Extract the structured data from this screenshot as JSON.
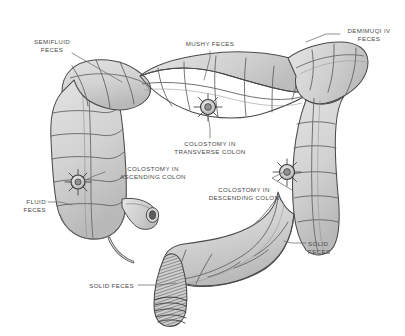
{
  "figure": {
    "background_color": "#ffffff",
    "colon_fill_color": "#d4d4d4",
    "colon_outline_color": "#4a4a4a",
    "label_color": "#4a4a4a",
    "leader_color": "#6b6b6b",
    "rectum_hatch_color": "#5a5a5a"
  },
  "labels": [
    {
      "id": "semifluid-feces",
      "line1": "SEMIFLUID",
      "line2": "FECES",
      "align": "center",
      "x": 24,
      "y": 38,
      "w": 56,
      "leader": [
        [
          72,
          53
        ],
        [
          84,
          60
        ],
        [
          122,
          82
        ]
      ]
    },
    {
      "id": "mushy-feces",
      "line1": "MUSHY FECES",
      "line2": "",
      "align": "center",
      "x": 178,
      "y": 40,
      "w": 64,
      "leader": [
        [
          210,
          51
        ],
        [
          210,
          58
        ],
        [
          204,
          80
        ]
      ]
    },
    {
      "id": "semimushy-feces",
      "line1": "DEMIMUQI IV",
      "line2": "FECES",
      "align": "center",
      "x": 341,
      "y": 27,
      "w": 56,
      "leader": [
        [
          340,
          34
        ],
        [
          326,
          34
        ],
        [
          306,
          42
        ]
      ]
    },
    {
      "id": "colostomy-transverse-colon",
      "line1": "COLOSTOMY IN",
      "line2": "TRANSVERSE COLON",
      "align": "center",
      "x": 163,
      "y": 140,
      "w": 94,
      "leader": [
        [
          210,
          138
        ],
        [
          210,
          128
        ],
        [
          208,
          116
        ]
      ]
    },
    {
      "id": "colostomy-ascending-colon",
      "line1": "COLOSTOMY IN",
      "line2": "ASCENDING COLON",
      "align": "center",
      "x": 107,
      "y": 165,
      "w": 92,
      "leader": [
        [
          105,
          172
        ],
        [
          94,
          176
        ],
        [
          86,
          180
        ]
      ]
    },
    {
      "id": "colostomy-descending-colon",
      "line1": "COLOSTOMY IN",
      "line2": "DESCENDING COLON",
      "align": "center",
      "x": 196,
      "y": 186,
      "w": 96,
      "leader": [
        [
          292,
          190
        ],
        [
          272,
          178
        ],
        [
          284,
          172
        ]
      ]
    },
    {
      "id": "fluid-feces",
      "line1": "FLUID",
      "line2": "FECES",
      "align": "right",
      "x": 10,
      "y": 198,
      "w": 36,
      "leader": [
        [
          48,
          202
        ],
        [
          60,
          202
        ],
        [
          72,
          205
        ]
      ]
    },
    {
      "id": "solid-feces-right",
      "line1": "SOLID",
      "line2": "FECES",
      "align": "left",
      "x": 308,
      "y": 240,
      "w": 36,
      "leader": [
        [
          306,
          243
        ],
        [
          292,
          243
        ],
        [
          284,
          241
        ]
      ]
    },
    {
      "id": "solid-feces-bottom",
      "line1": "SOLID FECES",
      "line2": "",
      "align": "right",
      "x": 72,
      "y": 282,
      "w": 62,
      "leader": [
        [
          138,
          285
        ],
        [
          158,
          285
        ],
        [
          176,
          283
        ]
      ]
    }
  ],
  "stoma_markers": [
    {
      "id": "stoma-transverse-colon",
      "cx": 208,
      "cy": 107,
      "r": 7.5
    },
    {
      "id": "stoma-ascending-colon",
      "cx": 78,
      "cy": 182,
      "r": 7.0
    },
    {
      "id": "stoma-descending-colon",
      "cx": 287,
      "cy": 172,
      "r": 7.5
    }
  ],
  "anatomy_parts": [
    "cecum",
    "ileum",
    "ascending-colon",
    "hepatic-flexure",
    "transverse-colon",
    "splenic-flexure",
    "descending-colon",
    "sigmoid-colon",
    "rectum",
    "anal-canal",
    "appendix"
  ]
}
